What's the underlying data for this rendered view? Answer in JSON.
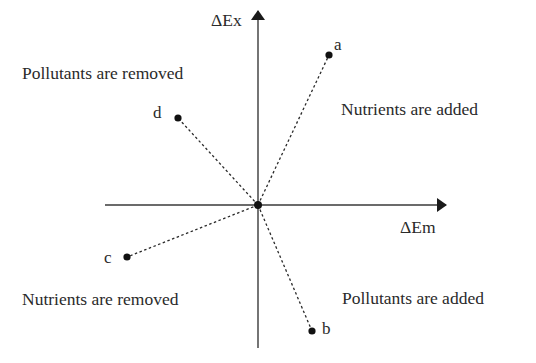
{
  "axes": {
    "y_label": "ΔEx",
    "x_label": "ΔEm"
  },
  "quadrants": {
    "top_left": "Pollutants are removed",
    "top_right": "Nutrients are added",
    "bottom_left": "Nutrients are removed",
    "bottom_right": "Pollutants are added"
  },
  "points": [
    {
      "label": "a",
      "x": 329,
      "y": 55
    },
    {
      "label": "b",
      "x": 312,
      "y": 331
    },
    {
      "label": "c",
      "x": 127,
      "y": 257
    },
    {
      "label": "d",
      "x": 178,
      "y": 118
    }
  ],
  "origin": {
    "x": 258,
    "y": 205
  },
  "colors": {
    "line": "#1a1a1a",
    "text": "#2a2a2a"
  }
}
